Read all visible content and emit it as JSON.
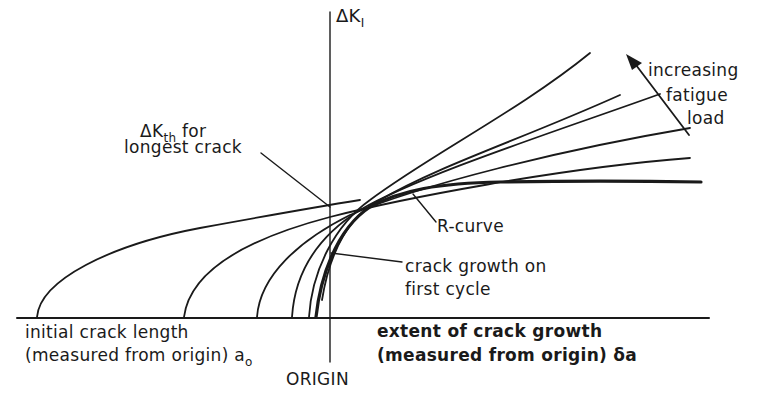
{
  "figure": {
    "type": "schematic R-curve diagram",
    "axes": {
      "y_label": "ΔK",
      "y_label_subscript": "I",
      "x_label_left_line1": "initial crack length",
      "x_label_left_line2": "(measured from origin) a",
      "x_label_left_subscript": "o",
      "x_label_right_line1": "extent of crack growth",
      "x_label_right_line2": "(measured from origin) δa",
      "origin_label": "ORIGIN"
    },
    "annotations": {
      "threshold_line1_prefix": "ΔK",
      "threshold_line1_subscript": "th",
      "threshold_line1_suffix": " for",
      "threshold_line2": "longest crack",
      "load_line1": "increasing",
      "load_line2": "fatigue",
      "load_line3": "load",
      "r_curve": "R-curve",
      "first_cycle_line1": "crack growth on",
      "first_cycle_line2": "first cycle"
    },
    "curves": [
      {
        "name": "load-curve-1",
        "start_x": 37,
        "description": "longest initial crack, lowest load"
      },
      {
        "name": "load-curve-2",
        "start_x": 184
      },
      {
        "name": "load-curve-3",
        "start_x": 257
      },
      {
        "name": "load-curve-4",
        "start_x": 292
      },
      {
        "name": "load-curve-5",
        "start_x": 309,
        "description": "shortest initial crack, highest load"
      },
      {
        "name": "r-curve",
        "description": "envelope curve, bold"
      }
    ],
    "colors": {
      "ink": "#1a1a1a",
      "background": "#ffffff"
    }
  }
}
